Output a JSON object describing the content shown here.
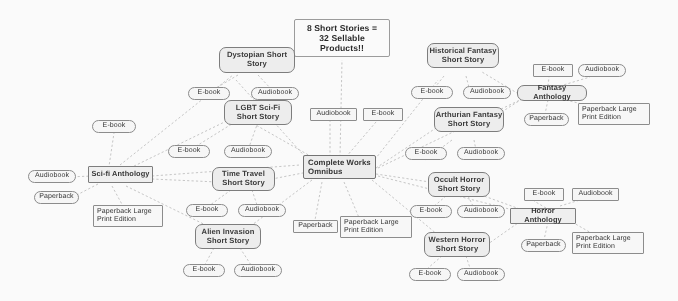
{
  "diagram": {
    "title": "8 Short Stories =\n32 Sellable\nProducts!!",
    "title_lines": [
      "8 Short Stories =",
      "32 Sellable",
      "Products!!"
    ],
    "center_hub": "Complete Works Omnibus",
    "format_labels": {
      "ebook": "E-book",
      "audiobook": "Audiobook",
      "paperback": "Paperback",
      "paperback_large": "Paperback Large Print Edition"
    },
    "nodes": [
      {
        "id": "title",
        "label": "8 Short Stories = 32 Sellable Products!!",
        "kind": "title"
      },
      {
        "id": "dystopian",
        "label": "Dystopian Short Story",
        "kind": "story"
      },
      {
        "id": "lgbt",
        "label": "LGBT Sci-Fi Short Story",
        "kind": "story"
      },
      {
        "id": "timetravel",
        "label": "Time Travel Short Story",
        "kind": "story"
      },
      {
        "id": "alien",
        "label": "Alien Invasion Short Story",
        "kind": "story"
      },
      {
        "id": "historical",
        "label": "Historical Fantasy Short Story",
        "kind": "story"
      },
      {
        "id": "arthurian",
        "label": "Arthurian Fantasy Short Story",
        "kind": "story"
      },
      {
        "id": "occult",
        "label": "Occult Horror Short Story",
        "kind": "story"
      },
      {
        "id": "western",
        "label": "Western Horror Short Story",
        "kind": "story"
      },
      {
        "id": "scifi_anth",
        "label": "Sci-fi Anthology",
        "kind": "anthology"
      },
      {
        "id": "fantasy_anth",
        "label": "Fantasy Anthology",
        "kind": "anthology"
      },
      {
        "id": "horror_anth",
        "label": "Horror Anthology",
        "kind": "anthology"
      },
      {
        "id": "omnibus",
        "label": "Complete Works Omnibus",
        "kind": "hub"
      }
    ],
    "labels": {
      "dystopian": "Dystopian Short\nStory",
      "dystopian_l1": "Dystopian Short",
      "dystopian_l2": "Story",
      "lgbt_l1": "LGBT Sci-Fi",
      "lgbt_l2": "Short Story",
      "timetravel_l1": "Time Travel",
      "timetravel_l2": "Short Story",
      "alien_l1": "Alien Invasion",
      "alien_l2": "Short Story",
      "historical_l1": "Historical Fantasy",
      "historical_l2": "Short Story",
      "arthurian_l1": "Arthurian Fantasy",
      "arthurian_l2": "Short Story",
      "occult_l1": "Occult Horror",
      "occult_l2": "Short Story",
      "western_l1": "Western Horror",
      "western_l2": "Short Story",
      "omnibus_l1": "Complete Works",
      "omnibus_l2": "Omnibus",
      "scifi_anth": "Sci-fi Anthology",
      "fantasy_anth": "Fantasy Anthology",
      "horror_anth": "Horror Anthology",
      "large_l1": "Paperback Large",
      "large_l2": "Print Edition"
    }
  }
}
